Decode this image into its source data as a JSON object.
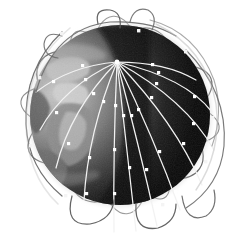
{
  "image": {
    "title": "Satellite constellation around Earth",
    "kind": "grayscale-photo-illustration",
    "width": 245,
    "height": 242,
    "background_color": "#ffffff"
  },
  "globe": {
    "name": "earth-globe",
    "center_x": 120,
    "center_y": 115,
    "radius": 90,
    "dark_color": "#060606",
    "terminator_color": "#1a1a1a",
    "lit_color": "#9a9a9a",
    "limb_glow_color": "#d8d8d8",
    "lit_side": "left",
    "continents_visible": "Africa and Europe on lit crescent"
  },
  "constellation": {
    "name": "satellite-constellation",
    "pole_node": {
      "x": 117,
      "y": 62,
      "label": "north-pole-convergence"
    },
    "meridian_color": "#f2f2f2",
    "meridian_count": 12,
    "meridians": [
      {
        "end_x": 114,
        "end_y": 232,
        "bow": -2,
        "nodes": [
          0.26,
          0.55,
          0.82
        ]
      },
      {
        "end_x": 136,
        "end_y": 231,
        "bow": 6,
        "nodes": [
          0.3,
          0.62,
          0.86
        ]
      },
      {
        "end_x": 157,
        "end_y": 226,
        "bow": 14,
        "nodes": [
          0.34,
          0.66
        ]
      },
      {
        "end_x": 180,
        "end_y": 210,
        "bow": 22,
        "nodes": [
          0.3,
          0.6,
          0.85
        ]
      },
      {
        "end_x": 202,
        "end_y": 185,
        "bow": 26,
        "nodes": [
          0.36,
          0.7
        ]
      },
      {
        "end_x": 214,
        "end_y": 150,
        "bow": 24,
        "nodes": [
          0.4,
          0.74
        ]
      },
      {
        "end_x": 212,
        "end_y": 112,
        "bow": 16,
        "nodes": [
          0.42,
          0.78
        ]
      },
      {
        "end_x": 196,
        "end_y": 80,
        "bow": 8,
        "nodes": [
          0.45
        ]
      },
      {
        "end_x": 36,
        "end_y": 92,
        "bow": -10,
        "nodes": [
          0.48,
          0.8
        ]
      },
      {
        "end_x": 40,
        "end_y": 130,
        "bow": -16,
        "nodes": [
          0.4,
          0.76
        ]
      },
      {
        "end_x": 56,
        "end_y": 168,
        "bow": -18,
        "nodes": [
          0.38,
          0.72
        ]
      },
      {
        "end_x": 84,
        "end_y": 200,
        "bow": -12,
        "nodes": [
          0.32,
          0.66,
          0.9
        ]
      }
    ],
    "rings": [
      {
        "label": "orbit-ring-1",
        "rx": 98,
        "ry": 36,
        "rotate": -22,
        "color": "#6f6f6f"
      },
      {
        "label": "orbit-ring-2",
        "rx": 100,
        "ry": 30,
        "rotate": 8,
        "color": "#828282"
      },
      {
        "label": "orbit-ring-3",
        "rx": 96,
        "ry": 42,
        "rotate": 34,
        "color": "#5f5f5f"
      },
      {
        "label": "orbit-ring-4",
        "rx": 94,
        "ry": 26,
        "rotate": 62,
        "color": "#777777"
      },
      {
        "label": "orbit-ring-5",
        "rx": 99,
        "ry": 34,
        "rotate": 86,
        "color": "#8b8b8b"
      },
      {
        "label": "orbit-ring-6",
        "rx": 92,
        "ry": 46,
        "rotate": 112,
        "color": "#6a6a6a"
      }
    ],
    "satellite_node_color": "#ffffff",
    "satellite_node_size": 3,
    "orbital_satellites": [
      {
        "x": 62,
        "y": 34
      },
      {
        "x": 40,
        "y": 78
      },
      {
        "x": 31,
        "y": 146
      },
      {
        "x": 66,
        "y": 196
      },
      {
        "x": 139,
        "y": 31
      },
      {
        "x": 186,
        "y": 52
      },
      {
        "x": 213,
        "y": 118
      },
      {
        "x": 206,
        "y": 162
      },
      {
        "x": 163,
        "y": 205
      }
    ]
  }
}
